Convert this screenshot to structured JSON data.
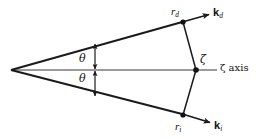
{
  "figure": {
    "kind": "scattering-geometry-diagram",
    "background_color": "#ffffff",
    "stroke_color": "#1a1a1a",
    "axis_color": "#6e6e6e",
    "width": 259,
    "height": 139,
    "labels": {
      "r_d": {
        "symbol": "r",
        "subscript": "d",
        "style": "italic"
      },
      "k_d": {
        "symbol": "k",
        "subscript": "d",
        "style": "bold-vector"
      },
      "r_i": {
        "symbol": "r",
        "subscript": "i",
        "style": "italic"
      },
      "k_i": {
        "symbol": "k",
        "subscript": "i",
        "style": "bold-vector"
      },
      "zeta_point": "ζ",
      "zeta_axis": "ζ axis",
      "theta_upper": "θ",
      "theta_lower": "θ"
    },
    "geometry": {
      "apex": {
        "x": 11,
        "y": 70
      },
      "point_rd": {
        "x": 183,
        "y": 22
      },
      "point_ri": {
        "x": 183,
        "y": 115
      },
      "point_zeta": {
        "x": 196,
        "y": 70
      },
      "axis_start": {
        "x": 11,
        "y": 70
      },
      "axis_end": {
        "x": 215,
        "y": 70
      },
      "kd_arrow_end": {
        "x": 211,
        "y": 14
      },
      "ki_arrow_end": {
        "x": 212,
        "y": 124
      },
      "theta_arc_upper": {
        "x": 95,
        "y": 45,
        "to_y": 70
      },
      "theta_arc_lower": {
        "x": 95,
        "y": 70,
        "to_y": 95
      }
    }
  }
}
